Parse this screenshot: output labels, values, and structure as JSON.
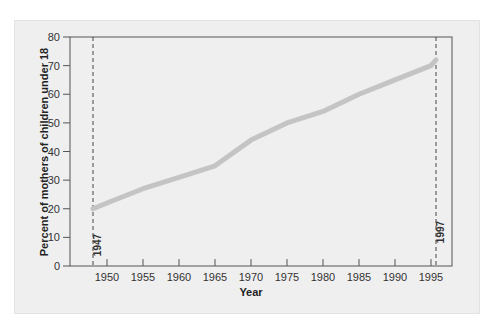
{
  "chart_data": {
    "type": "line",
    "title": "",
    "xlabel": "Year",
    "ylabel": "Percent of mothers of children under 18",
    "xlim": [
      1944,
      1999
    ],
    "ylim": [
      0,
      80
    ],
    "x_ticks": [
      1950,
      1955,
      1960,
      1965,
      1970,
      1975,
      1980,
      1985,
      1990,
      1995
    ],
    "y_ticks": [
      0,
      10,
      20,
      30,
      40,
      50,
      60,
      70,
      80
    ],
    "grid": false,
    "legend": null,
    "series": [
      {
        "name": "Percent of mothers of children under 18 in labor force",
        "color": "#c4c4c4",
        "x": [
          1947,
          1950,
          1955,
          1960,
          1965,
          1970,
          1975,
          1980,
          1985,
          1990,
          1995,
          1997
        ],
        "values": [
          20,
          22,
          27,
          31,
          35,
          44,
          50,
          54,
          60,
          65,
          70,
          72
        ]
      }
    ],
    "annotations": [
      {
        "type": "vline",
        "x": 1947,
        "label": "1947",
        "style": "dashed"
      },
      {
        "type": "vline",
        "x": 1997,
        "label": "1997",
        "style": "dashed"
      }
    ]
  },
  "labels": {
    "xlabel": "Year",
    "ylabel": "Percent of mothers of children under 18",
    "marker_start": "1947",
    "marker_end": "1997"
  }
}
